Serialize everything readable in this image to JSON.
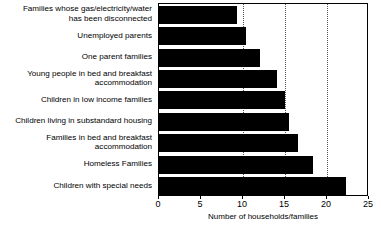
{
  "chart_data": {
    "type": "bar",
    "orientation": "horizontal",
    "title": "",
    "xlabel": "Number of households/families",
    "ylabel": "",
    "xlim": [
      0,
      25
    ],
    "xticks": [
      0,
      5,
      10,
      15,
      20,
      25
    ],
    "xtick_labels": [
      "0",
      "5",
      "10",
      "15",
      "20",
      "25"
    ],
    "gridlines": [
      10,
      15,
      20
    ],
    "grid": true,
    "legend": "none",
    "bar_color": "#000000",
    "categories": [
      "Families whose gas/electricity/water\nhas been disconnected",
      "Unemployed parents",
      "One parent families",
      "Young people in bed and breakfast\naccommodation",
      "Children in low income families",
      "Children living in substandard housing",
      "Families in bed and breakfast\naccommodation",
      "Homeless Families",
      "Children with special needs"
    ],
    "values": [
      9.3,
      10.3,
      12,
      14,
      15,
      15.5,
      16.5,
      18.3,
      22.3
    ]
  }
}
